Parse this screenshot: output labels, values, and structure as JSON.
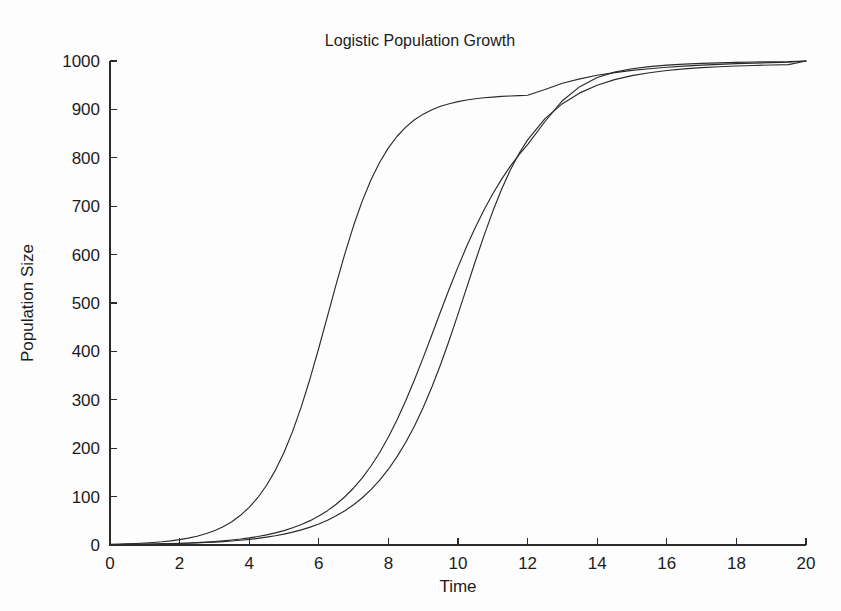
{
  "figure": {
    "background_color": "#fdfdfd",
    "line_color": "#2a2a2a",
    "text_color": "#1c1c1c"
  },
  "chart_data": {
    "type": "line",
    "title": "Logistic Population Growth",
    "xlabel": "Time",
    "ylabel": "Population Size",
    "xlim": [
      0,
      20
    ],
    "ylim": [
      0,
      1000
    ],
    "grid": false,
    "legend": "none",
    "xticks": [
      0,
      2,
      4,
      6,
      8,
      10,
      12,
      14,
      16,
      18,
      20
    ],
    "xtick_labels": [
      "0",
      "2",
      "4",
      "6",
      "8",
      "10",
      "12",
      "14",
      "16",
      "18",
      "20"
    ],
    "yticks": [
      0,
      100,
      200,
      300,
      400,
      500,
      600,
      700,
      800,
      900,
      1000
    ],
    "ytick_labels": [
      "0",
      "100",
      "200",
      "300",
      "400",
      "500",
      "600",
      "700",
      "800",
      "900",
      "1000"
    ],
    "x": [
      0,
      0.25,
      0.5,
      0.75,
      1,
      1.25,
      1.5,
      1.75,
      2,
      2.25,
      2.5,
      2.75,
      3,
      3.25,
      3.5,
      3.75,
      4,
      4.25,
      4.5,
      4.75,
      5,
      5.25,
      5.5,
      5.75,
      6,
      6.25,
      6.5,
      6.75,
      7,
      7.25,
      7.5,
      7.75,
      8,
      8.25,
      8.5,
      8.75,
      9,
      9.25,
      9.5,
      9.75,
      10,
      10.25,
      10.5,
      10.75,
      11,
      11.25,
      11.5,
      11.75,
      12,
      12.5,
      13,
      13.5,
      14,
      14.5,
      15,
      15.5,
      16,
      16.5,
      17,
      17.5,
      18,
      18.5,
      19,
      19.5,
      20
    ],
    "series": [
      {
        "name": "fast-growth-curve",
        "carrying_capacity": 1000,
        "growth_rate": 1.0,
        "initial_population": 1.5,
        "values": [
          1.5,
          1.9,
          2.5,
          3.2,
          4.1,
          5.2,
          6.7,
          8.6,
          11.0,
          14.1,
          18.1,
          23.2,
          29.6,
          37.8,
          48.2,
          61.3,
          77.8,
          98.2,
          123.4,
          154.2,
          191.3,
          235.3,
          286.4,
          344.1,
          407.0,
          472.9,
          538.9,
          602.1,
          660.0,
          711.0,
          754.6,
          790.9,
          820.6,
          844.5,
          863.5,
          878.5,
          890.2,
          899.3,
          906.4,
          911.8,
          916.1,
          919.4,
          922.0,
          924.0,
          925.5,
          926.8,
          927.7,
          928.5,
          929.2,
          941.0,
          954.0,
          963.0,
          970.5,
          976.0,
          980.5,
          984.0,
          987.0,
          989.5,
          991.5,
          993.0,
          994.5,
          995.7,
          996.6,
          997.4,
          1000.0
        ]
      },
      {
        "name": "medium-growth-euler-curve",
        "carrying_capacity": 1000,
        "growth_rate": 0.78,
        "initial_population": 1.0,
        "note": "piecewise-linear / discretized approximation with a visible kink near t=11",
        "values": [
          1.0,
          1.1,
          1.3,
          1.5,
          1.8,
          2.1,
          2.5,
          3.0,
          3.6,
          4.2,
          5.1,
          6.0,
          7.2,
          8.6,
          10.3,
          12.3,
          14.7,
          17.5,
          20.9,
          25.0,
          29.8,
          35.5,
          42.3,
          50.3,
          59.8,
          71.0,
          84.2,
          99.7,
          117.8,
          138.8,
          163.2,
          191.2,
          223.0,
          258.8,
          298.4,
          341.4,
          387.1,
          434.5,
          482.3,
          529.5,
          574.6,
          617.1,
          656.5,
          692.7,
          725.7,
          755.5,
          782.2,
          806.0,
          827.1,
          875.0,
          918.0,
          947.0,
          966.0,
          977.0,
          984.0,
          988.5,
          991.5,
          993.5,
          995.0,
          996.2,
          997.2,
          997.9,
          998.4,
          998.8,
          1000.0
        ]
      },
      {
        "name": "slow-growth-curve",
        "carrying_capacity": 1000,
        "growth_rate": 0.72,
        "initial_population": 1.0,
        "values": [
          1.0,
          1.1,
          1.2,
          1.4,
          1.6,
          1.9,
          2.2,
          2.6,
          3.1,
          3.6,
          4.3,
          5.1,
          6.0,
          7.0,
          8.3,
          9.8,
          11.6,
          13.7,
          16.2,
          19.1,
          22.5,
          26.6,
          31.3,
          36.9,
          43.5,
          51.2,
          60.3,
          70.9,
          83.3,
          97.7,
          114.5,
          134.0,
          156.6,
          182.6,
          212.3,
          246.0,
          284.0,
          326.3,
          373.0,
          423.5,
          477.0,
          531.9,
          586.7,
          639.8,
          689.4,
          734.5,
          774.1,
          808.3,
          837.1,
          880.8,
          911.9,
          934.1,
          950.0,
          961.5,
          969.8,
          975.8,
          980.3,
          983.6,
          986.2,
          988.1,
          989.6,
          990.8,
          991.7,
          992.4,
          1000.0
        ]
      }
    ]
  }
}
